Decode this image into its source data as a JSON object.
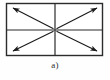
{
  "figure": {
    "caption": "a)",
    "title": ""
  },
  "colors": {
    "background": "#fefefe",
    "stroke": "#2b2b2b",
    "arrow_fill": "#1a1a1a"
  },
  "diagram_data": {
    "type": "diagram",
    "shape": "rectangle",
    "rect": {
      "x": 6,
      "y": 3,
      "width": 97,
      "height": 53
    },
    "dividers": [
      {
        "name": "vertical-divider",
        "orientation": "vertical",
        "x": 55,
        "y1": 3,
        "y2": 56
      },
      {
        "name": "horizontal-divider",
        "orientation": "horizontal",
        "y": 30,
        "x1": 6,
        "x2": 103
      }
    ],
    "center": {
      "x": 55,
      "y": 30
    },
    "arrows": [
      {
        "name": "arrow-up-left",
        "quadrant": "top-left",
        "from": {
          "x": 55,
          "y": 30
        },
        "to": {
          "x": 11,
          "y": 7
        },
        "direction": "outward"
      },
      {
        "name": "arrow-up-right",
        "quadrant": "top-right",
        "from": {
          "x": 55,
          "y": 30
        },
        "to": {
          "x": 99,
          "y": 7
        },
        "direction": "outward"
      },
      {
        "name": "arrow-down-left",
        "quadrant": "bottom-left",
        "from": {
          "x": 55,
          "y": 30
        },
        "to": {
          "x": 11,
          "y": 52
        },
        "direction": "outward"
      },
      {
        "name": "arrow-down-right",
        "quadrant": "bottom-right",
        "from": {
          "x": 55,
          "y": 30
        },
        "to": {
          "x": 99,
          "y": 52
        },
        "direction": "outward"
      }
    ],
    "arrow_count": 4,
    "quadrant_count": 4
  }
}
